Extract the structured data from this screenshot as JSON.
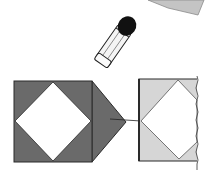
{
  "figure": {
    "colors": {
      "background": "#ffffff",
      "dark_paper": "#6a6a6a",
      "light_paper": "#d6d6d6",
      "outline": "#2a2a2a",
      "glue_cap": "#111111",
      "glue_body": "#f4f4f4",
      "top_sheet": "#c4c4c4"
    },
    "elements": {
      "top_sheet": "paper-sheet-corner",
      "glue_stick": "glue-stick-icon",
      "left_square": "folded-square",
      "flap": "triangle-flap",
      "right_panel": "target-sheet",
      "arrow": "fold-direction-arrow"
    }
  }
}
